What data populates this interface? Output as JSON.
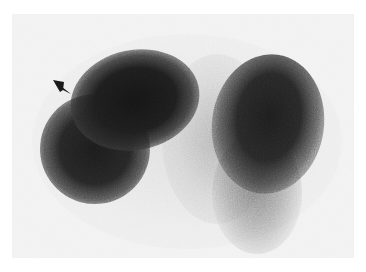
{
  "image": {
    "kind": "grayscale nuclear scintigraphy scan",
    "background_color": "#ffffff",
    "frame_color": "#f1f1f1",
    "uptake_color": "#141414",
    "annotations": [
      {
        "type": "arrowhead",
        "icon": "arrowhead-pointer-icon",
        "points_to": "upper-left dark region",
        "color": "#1a1a1a"
      }
    ],
    "regions": [
      {
        "name": "left-lobe",
        "description": "large dark uptake region, upper left"
      },
      {
        "name": "right-lobe",
        "description": "dark uptake region, upper right, tapering downward"
      },
      {
        "name": "central-haze",
        "description": "lighter diffuse uptake between lobes"
      }
    ]
  }
}
